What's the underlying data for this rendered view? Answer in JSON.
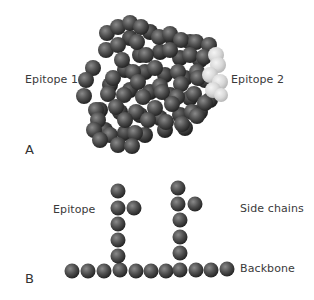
{
  "panel_a": {
    "letter": "A",
    "labels": {
      "epitope_1": "Epitope 1",
      "epitope_2": "Epitope 2"
    },
    "colors": {
      "sphere_dark": "#4a4a4a",
      "sphere_light": "#d8d8d8"
    }
  },
  "panel_b": {
    "letter": "B",
    "labels": {
      "epitope": "Epitope",
      "side_chains": "Side chains",
      "backbone": "Backbone"
    },
    "colors": {
      "sphere": "#4a4a4a"
    }
  }
}
